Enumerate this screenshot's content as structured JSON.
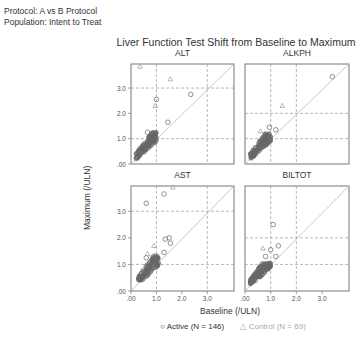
{
  "header": {
    "protocol": "Protocol: A vs B Protocol",
    "population": "Population: Intent to Treat"
  },
  "chart_data": {
    "type": "scatter",
    "title": "Liver Function Test Shift from Baseline to Maximum",
    "xlabel": "Baseline (/ULN)",
    "ylabel": "Maximum (/ULN)",
    "xlim": [
      0,
      4.05
    ],
    "ylim": [
      0,
      3.95
    ],
    "x_ticks": [
      ".00",
      "1.0",
      "2.0",
      "3.0"
    ],
    "y_ticks": [
      ".00",
      "1.0",
      "2.0",
      "3.0"
    ],
    "reference_lines": {
      "x": [
        1.0,
        3.0
      ],
      "y": [
        1.0,
        3.0
      ],
      "identity_diagonal": true
    },
    "legend": [
      {
        "label": "Active (N = 146)",
        "marker": "circle",
        "color": "#555555"
      },
      {
        "label": "Control (N = 69)",
        "marker": "triangle",
        "color": "#aaaaaa"
      }
    ],
    "panels": [
      {
        "name": "ALT",
        "ref": {
          "x": [
            1.0,
            3.0
          ],
          "y": [
            1.0,
            3.0
          ]
        },
        "outliers_active": [
          [
            1.0,
            2.55
          ],
          [
            2.35,
            2.75
          ],
          [
            1.45,
            1.65
          ],
          [
            0.95,
            1.2
          ],
          [
            0.65,
            1.25
          ]
        ],
        "outliers_control": [
          [
            0.35,
            3.85
          ],
          [
            1.55,
            3.35
          ],
          [
            0.95,
            2.3
          ]
        ],
        "cluster": {
          "x_range": [
            0.2,
            1.0
          ],
          "y_range": [
            0.2,
            1.25
          ]
        }
      },
      {
        "name": "ALKPH",
        "ref": {
          "x": [
            1.0,
            2.0
          ],
          "y": [
            1.0,
            2.0
          ]
        },
        "outliers_active": [
          [
            3.4,
            3.45
          ],
          [
            0.95,
            1.45
          ],
          [
            1.2,
            1.35
          ]
        ],
        "outliers_control": [
          [
            1.45,
            2.3
          ],
          [
            0.6,
            1.3
          ]
        ],
        "cluster": {
          "x_range": [
            0.2,
            1.0
          ],
          "y_range": [
            0.2,
            1.2
          ]
        }
      },
      {
        "name": "AST",
        "ref": {
          "x": [
            1.0,
            3.0
          ],
          "y": [
            1.0,
            3.0
          ]
        },
        "outliers_active": [
          [
            0.6,
            3.3
          ],
          [
            1.3,
            3.65
          ],
          [
            1.35,
            1.95
          ],
          [
            1.5,
            2.0
          ],
          [
            1.55,
            1.8
          ],
          [
            1.3,
            1.45
          ],
          [
            0.6,
            1.25
          ]
        ],
        "outliers_control": [
          [
            1.65,
            3.9
          ],
          [
            0.9,
            1.7
          ],
          [
            0.65,
            1.4
          ]
        ],
        "cluster": {
          "x_range": [
            0.3,
            1.1
          ],
          "y_range": [
            0.4,
            1.35
          ]
        }
      },
      {
        "name": "BILTOT",
        "ref": {
          "x": [
            1.0,
            2.0
          ],
          "y": [
            1.0,
            2.0
          ]
        },
        "outliers_active": [
          [
            1.1,
            2.5
          ],
          [
            1.3,
            1.7
          ],
          [
            1.0,
            1.55
          ],
          [
            1.2,
            1.3
          ],
          [
            0.8,
            1.3
          ]
        ],
        "outliers_control": [
          [
            0.7,
            1.6
          ]
        ],
        "cluster": {
          "x_range": [
            0.2,
            1.0
          ],
          "y_range": [
            0.25,
            1.05
          ]
        }
      }
    ]
  }
}
